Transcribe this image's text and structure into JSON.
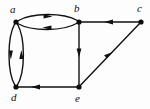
{
  "figure": {
    "width": 150,
    "height": 109,
    "background_color": "#fdfdfd",
    "ink_color": "#0d0d0d"
  },
  "nodes": [
    {
      "id": "a",
      "label": "a",
      "x": 16,
      "y": 22,
      "label_x": 10,
      "label_y": 4
    },
    {
      "id": "b",
      "label": "b",
      "x": 79,
      "y": 22,
      "label_x": 74,
      "label_y": 3
    },
    {
      "id": "c",
      "label": "c",
      "x": 141,
      "y": 22,
      "label_x": 137,
      "label_y": 3
    },
    {
      "id": "d",
      "label": "d",
      "x": 16,
      "y": 87,
      "label_x": 11,
      "label_y": 92
    },
    {
      "id": "e",
      "label": "e",
      "x": 79,
      "y": 87,
      "label_x": 75,
      "label_y": 93
    }
  ],
  "edges": [
    {
      "id": "a-b-top",
      "from": "a",
      "to": "b",
      "style": "curved-up",
      "arrow_direction": "right"
    },
    {
      "id": "b-a-bottom",
      "from": "b",
      "to": "a",
      "style": "curved-down",
      "arrow_direction": "left"
    },
    {
      "id": "d-a-left",
      "from": "d",
      "to": "a",
      "style": "curved-left",
      "arrow_direction": "up"
    },
    {
      "id": "a-d-right",
      "from": "a",
      "to": "d",
      "style": "curved-right",
      "arrow_direction": "down"
    },
    {
      "id": "b-e",
      "from": "b",
      "to": "e",
      "style": "straight",
      "arrow_direction": "down"
    },
    {
      "id": "e-d",
      "from": "e",
      "to": "d",
      "style": "straight",
      "arrow_direction": "left"
    },
    {
      "id": "c-b",
      "from": "c",
      "to": "b",
      "style": "straight",
      "arrow_direction": "left"
    },
    {
      "id": "e-c",
      "from": "e",
      "to": "c",
      "style": "straight",
      "arrow_direction": "up-right"
    }
  ]
}
